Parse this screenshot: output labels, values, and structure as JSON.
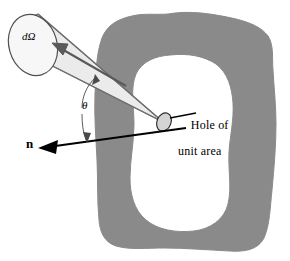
{
  "figure": {
    "background_color": "#ffffff"
  },
  "labels": {
    "solid_angle": "dΩ",
    "angle_theta": "θ",
    "normal_vector": "n",
    "hole_line1": "Hole of",
    "hole_line2": "unit area"
  },
  "colors": {
    "cavity_wall_fill": "#8a8a8a",
    "cavity_wall_stroke": "#8a8a8a",
    "cone_fill": "#ebebeb",
    "cone_stroke": "#6e6e6e",
    "ellipse_fill": "#f5f5f5",
    "ellipse_stroke": "#555555",
    "hole_fill": "#d8d8d8",
    "hole_stroke": "#333333",
    "arrow_color": "#4a4a4a",
    "normal_arrow_color": "#000000",
    "leader_color": "#000000",
    "text_color": "#000000"
  },
  "geometry": {
    "cone_apex": {
      "x": 163,
      "y": 122
    },
    "dome_center": {
      "x": 38,
      "y": 45
    },
    "dome_rx": 24,
    "dome_ry": 31,
    "hole_center": {
      "x": 163,
      "y": 122
    },
    "hole_rx": 7,
    "hole_ry": 9,
    "normal_arrow_tip": {
      "x": 42,
      "y": 148
    },
    "normal_arrow_tail": {
      "x": 186,
      "y": 127
    },
    "theta_arc_label": {
      "x": 86,
      "y": 110
    },
    "leader_start": {
      "x": 175,
      "y": 118
    },
    "leader_end": {
      "x": 196,
      "y": 113
    }
  },
  "elements": {
    "cavity_wall_name": "cavity-wall-shape",
    "cavity_interior_name": "cavity-interior",
    "cone_name": "solid-angle-cone",
    "dome_name": "solid-angle-aperture-ellipse",
    "hole_name": "hole-ellipse",
    "ray_arrow_name": "radiation-direction-arrow",
    "normal_arrow_name": "surface-normal-arrow",
    "theta_arc_name": "theta-angle-arc",
    "leader_name": "hole-label-leader-line"
  }
}
